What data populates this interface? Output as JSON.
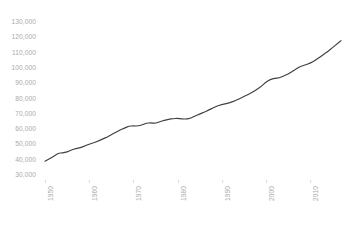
{
  "chart_data": {
    "type": "line",
    "title": "",
    "subtitle": "",
    "xlabel": "",
    "ylabel": "",
    "grid": false,
    "legend": null,
    "legend_position": "none",
    "line_color": "#404040",
    "tick_label_color": "#a9a9a9",
    "background_color": "#ffffff",
    "xlim": [
      1950,
      2017
    ],
    "ylim": [
      30000,
      130000
    ],
    "y_ticks": [
      30000,
      40000,
      50000,
      60000,
      70000,
      80000,
      90000,
      100000,
      110000,
      120000,
      130000
    ],
    "y_tick_labels": [
      "30,000",
      "40,000",
      "50,000",
      "60,000",
      "70,000",
      "80,000",
      "90,000",
      "100,000",
      "110,000",
      "120,000",
      "130,000"
    ],
    "x_ticks": [
      1950,
      1960,
      1970,
      1980,
      1990,
      2000,
      2010
    ],
    "x_tick_labels": [
      "1950",
      "1960",
      "1970",
      "1980",
      "1990",
      "2000",
      "2010"
    ],
    "x_tick_rotation": 90,
    "series": [
      {
        "name": "",
        "x": [
          1950,
          1951,
          1952,
          1953,
          1954,
          1955,
          1956,
          1957,
          1958,
          1959,
          1960,
          1961,
          1962,
          1963,
          1964,
          1965,
          1966,
          1967,
          1968,
          1969,
          1970,
          1971,
          1972,
          1973,
          1974,
          1975,
          1976,
          1977,
          1978,
          1979,
          1980,
          1981,
          1982,
          1983,
          1984,
          1985,
          1986,
          1987,
          1988,
          1989,
          1990,
          1991,
          1992,
          1993,
          1994,
          1995,
          1996,
          1997,
          1998,
          1999,
          2000,
          2001,
          2002,
          2003,
          2004,
          2005,
          2006,
          2007,
          2008,
          2009,
          2010,
          2011,
          2012,
          2013,
          2014,
          2015,
          2016,
          2017
        ],
        "values": [
          39000,
          40600,
          42300,
          44200,
          44500,
          45100,
          46400,
          47300,
          47800,
          49000,
          50200,
          51000,
          52200,
          53400,
          54800,
          56300,
          57800,
          59300,
          60700,
          61900,
          62100,
          62000,
          62700,
          63900,
          64100,
          63800,
          64900,
          65700,
          66400,
          66900,
          67000,
          66700,
          66500,
          67200,
          68600,
          69900,
          71000,
          72300,
          73800,
          75000,
          76100,
          76600,
          77400,
          78500,
          79800,
          81300,
          82700,
          84200,
          86000,
          88000,
          90800,
          92500,
          93100,
          93500,
          94600,
          96000,
          97800,
          99600,
          101200,
          102000,
          103000,
          104600,
          106600,
          108700,
          110800,
          113000,
          115400,
          117800
        ]
      }
    ]
  }
}
